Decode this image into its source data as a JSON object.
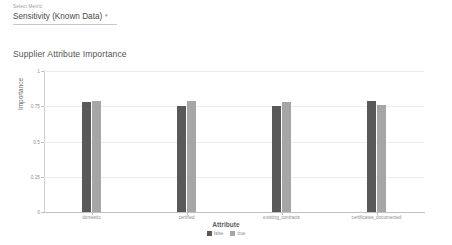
{
  "selector": {
    "label": "Select Metric",
    "value": "Sensitivity (Known Data)",
    "caret": "▾"
  },
  "chart_data": {
    "type": "bar",
    "title": "Supplier Attribute Importance",
    "xlabel": "Attribute",
    "ylabel": "Importance",
    "ylim": [
      0,
      1
    ],
    "yticks": [
      "0",
      "0.25",
      "0.5",
      "0.75",
      "1"
    ],
    "ytick_values": [
      0,
      0.25,
      0.5,
      0.75,
      1
    ],
    "grid": true,
    "legend_position": "bottom",
    "categories": [
      "domestic",
      "certified",
      "existing_contracts",
      "certificates_documented"
    ],
    "series": [
      {
        "name": "false",
        "color": "#595959",
        "values": [
          0.78,
          0.75,
          0.75,
          0.79
        ]
      },
      {
        "name": "true",
        "color": "#a6a6a6",
        "values": [
          0.79,
          0.79,
          0.78,
          0.76
        ]
      }
    ]
  }
}
